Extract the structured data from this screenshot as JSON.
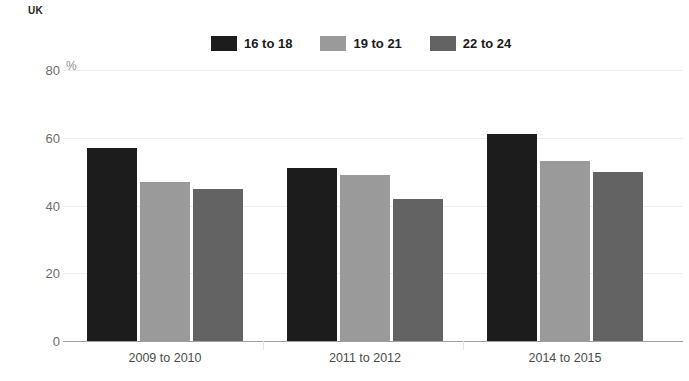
{
  "region_label": "UK",
  "legend": {
    "position": "top-center",
    "items": [
      {
        "label": "16 to 18",
        "color": "#1c1c1c"
      },
      {
        "label": "19 to 21",
        "color": "#9a9a9a"
      },
      {
        "label": "22 to 24",
        "color": "#636363"
      }
    ]
  },
  "axis": {
    "y_unit": "%",
    "y_ticks": [
      "0",
      "20",
      "40",
      "60",
      "80"
    ]
  },
  "chart_data": {
    "type": "bar",
    "title": "",
    "subtitle": "",
    "xlabel": "",
    "ylabel": "%",
    "ylim": [
      0,
      80
    ],
    "ytick_values": [
      0,
      20,
      40,
      60,
      80
    ],
    "grid": true,
    "legend_position": "top-center",
    "categories": [
      "2009 to 2010",
      "2011 to 2012",
      "2014 to 2015"
    ],
    "series": [
      {
        "name": "16 to 18",
        "color": "#1c1c1c",
        "values": [
          57,
          51,
          61
        ]
      },
      {
        "name": "19 to 21",
        "color": "#9a9a9a",
        "values": [
          47,
          49,
          53
        ]
      },
      {
        "name": "22 to 24",
        "color": "#636363",
        "values": [
          45,
          42,
          50
        ]
      }
    ],
    "annotations": [
      "UK"
    ]
  }
}
